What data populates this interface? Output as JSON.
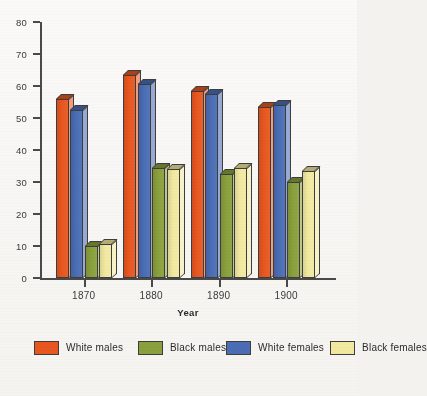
{
  "chart_data": {
    "type": "bar",
    "title": "",
    "xlabel": "Year",
    "ylabel": "",
    "categories": [
      "1870",
      "1880",
      "1890",
      "1900"
    ],
    "ylim": [
      0,
      80
    ],
    "yticks": [
      0,
      10,
      20,
      30,
      40,
      50,
      60,
      70,
      80
    ],
    "grid": false,
    "legend_position": "bottom",
    "series": [
      {
        "name": "White males",
        "color": "#E8571F",
        "values": [
          56,
          63.5,
          58.5,
          53.5
        ]
      },
      {
        "name": "White females",
        "color": "#4A6DB5",
        "values": [
          52.5,
          60.5,
          57.5,
          54
        ]
      },
      {
        "name": "Black males",
        "color": "#8AA03C",
        "values": [
          10,
          34.5,
          32.5,
          30
        ]
      },
      {
        "name": "Black females",
        "color": "#F2E9A0",
        "values": [
          10.5,
          34,
          34.5,
          33.5
        ]
      }
    ]
  },
  "axis": {
    "y_tick_labels": [
      "0",
      "10",
      "20",
      "30",
      "40",
      "50",
      "60",
      "70",
      "80"
    ],
    "x_tick_labels": [
      "1870",
      "1880",
      "1890",
      "1900"
    ],
    "x_title": "Year"
  },
  "legend": {
    "entries": [
      {
        "label": "White males",
        "color": "#E8571F"
      },
      {
        "label": "Black males",
        "color": "#8AA03C"
      },
      {
        "label": "White females",
        "color": "#4A6DB5"
      },
      {
        "label": "Black females",
        "color": "#F2E9A0"
      }
    ]
  },
  "colors": {
    "white_males": "#E8571F",
    "white_females": "#4A6DB5",
    "black_males": "#8AA03C",
    "black_females": "#F2E9A0",
    "axis": "#4A4A4A",
    "background": "#F5F3F0"
  }
}
